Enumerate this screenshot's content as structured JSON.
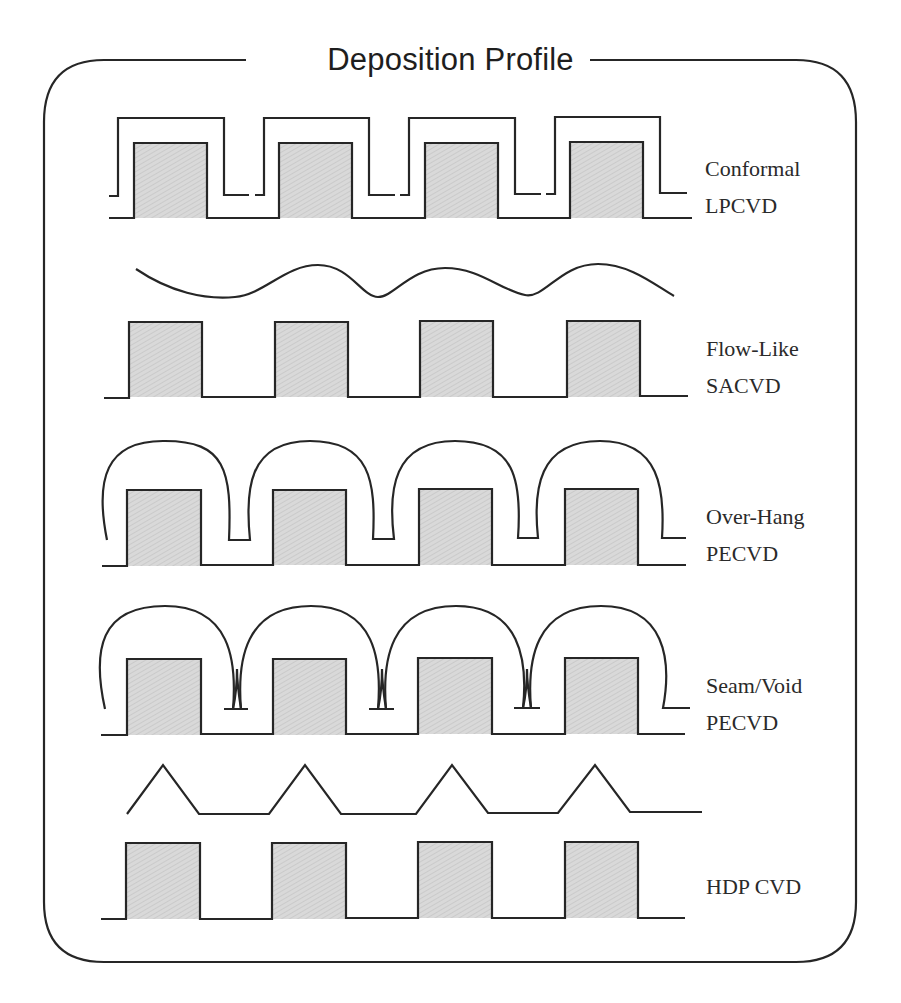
{
  "title": "Deposition Profile",
  "colors": {
    "line": "#262626",
    "block_fill": "#d6d6d6",
    "background": "#ffffff"
  },
  "profiles": [
    {
      "id": "conformal",
      "line1": "Conformal",
      "line2": "LPCVD",
      "shape": "conformal-film"
    },
    {
      "id": "flow-like",
      "line1": "Flow-Like",
      "line2": "SACVD",
      "shape": "wavy-film"
    },
    {
      "id": "over-hang",
      "line1": "Over-Hang",
      "line2": "PECVD",
      "shape": "overhang-film"
    },
    {
      "id": "seam-void",
      "line1": "Seam/Void",
      "line2": "PECVD",
      "shape": "seam-void-film"
    },
    {
      "id": "hdp",
      "line1": "HDP CVD",
      "line2": "",
      "shape": "triangular-film"
    }
  ],
  "block_count_per_row": 4
}
